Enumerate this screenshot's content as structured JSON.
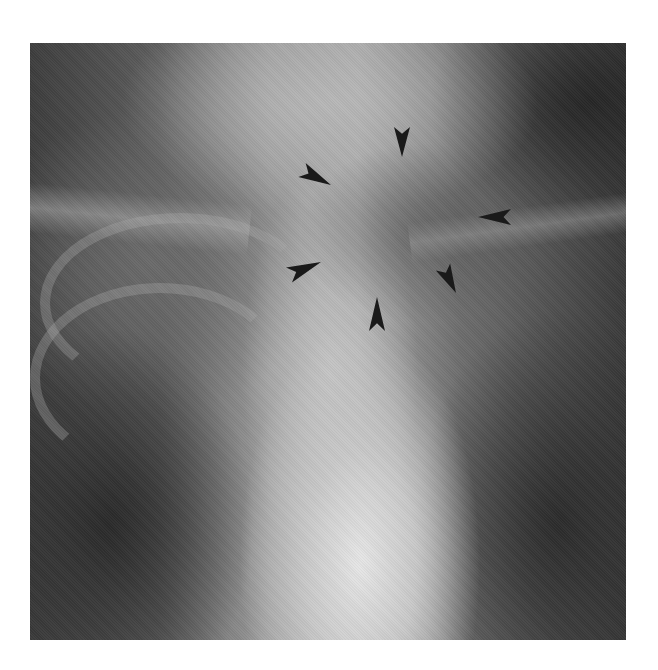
{
  "figure": {
    "type": "radiograph",
    "colors": {
      "background": "#ffffff",
      "arrowhead": "#1a1a1a",
      "dark_lung": "#2c2c2c",
      "bright_trachea": "#e6e6e6"
    },
    "annotations": {
      "arrowheads": [
        {
          "id": "top",
          "tip": [
            372,
            114
          ],
          "tail": [
            372,
            84
          ]
        },
        {
          "id": "upper-left",
          "tip": [
            301,
            142
          ],
          "tail": [
            272,
            127
          ]
        },
        {
          "id": "right",
          "tip": [
            448,
            174
          ],
          "tail": [
            481,
            174
          ]
        },
        {
          "id": "lower-right",
          "tip": [
            426,
            250
          ],
          "tail": [
            413,
            224
          ]
        },
        {
          "id": "bottom",
          "tip": [
            347,
            254
          ],
          "tail": [
            347,
            288
          ]
        },
        {
          "id": "left",
          "tip": [
            291,
            219
          ],
          "tail": [
            259,
            232
          ]
        }
      ]
    }
  }
}
